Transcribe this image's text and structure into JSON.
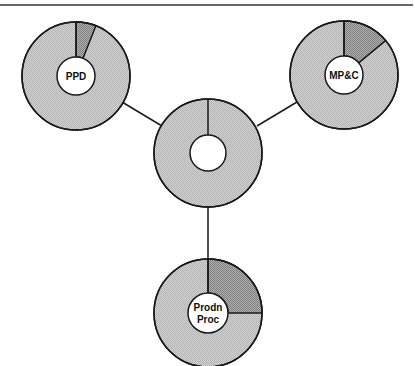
{
  "diagram": {
    "type": "hub-and-spoke donut diagram",
    "top_rule": {
      "y": 5,
      "x1": 0,
      "x2": 413,
      "color": "#333333"
    },
    "colors": {
      "light_fill": "#c9c9c9",
      "dark_fill": "#9a9a9a",
      "stroke": "#1a1a1a",
      "hole_fill": "#ffffff",
      "background": "#ffffff"
    },
    "nodes": [
      {
        "id": "hub",
        "label_lines": [],
        "cx": 208,
        "cy": 153,
        "r_outer": 54,
        "r_inner": 18,
        "highlight_fraction": 0.0,
        "show_start_divider": true
      },
      {
        "id": "ppd",
        "label_lines": [
          "PPD"
        ],
        "cx": 76,
        "cy": 76,
        "r_outer": 54,
        "r_inner": 19,
        "highlight_fraction": 0.06,
        "show_start_divider": true
      },
      {
        "id": "mpc",
        "label_lines": [
          "MP&C"
        ],
        "cx": 344,
        "cy": 75,
        "r_outer": 54,
        "r_inner": 19,
        "highlight_fraction": 0.14,
        "show_start_divider": true
      },
      {
        "id": "prodn-proc",
        "label_lines": [
          "Prodn",
          "Proc"
        ],
        "cx": 208,
        "cy": 313,
        "r_outer": 54,
        "r_inner": 20,
        "highlight_fraction": 0.25,
        "show_start_divider": true
      }
    ],
    "connectors": [
      {
        "from": "hub",
        "to": "ppd",
        "x1": 162,
        "y1": 126,
        "x2": 122,
        "y2": 102
      },
      {
        "from": "hub",
        "to": "mpc",
        "x1": 257,
        "y1": 126,
        "x2": 297,
        "y2": 102
      },
      {
        "from": "hub",
        "to": "prodn-proc",
        "x1": 208,
        "y1": 207,
        "x2": 208,
        "y2": 259
      }
    ]
  }
}
